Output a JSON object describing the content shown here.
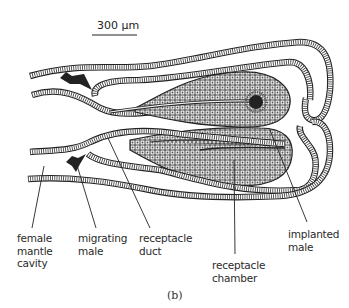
{
  "figure": {
    "panel_label": "(b)",
    "scale_bar": {
      "label": "300 μm"
    },
    "labels": {
      "female_mantle_cavity": [
        "female",
        "mantle",
        "cavity"
      ],
      "migrating_male": [
        "migrating",
        "male"
      ],
      "receptacle_duct": [
        "receptacle",
        "duct"
      ],
      "receptacle_chamber": [
        "receptacle",
        "chamber"
      ],
      "implanted_male": [
        "implanted",
        "male"
      ]
    }
  },
  "colors": {
    "ink": "#222222",
    "background": "#ffffff",
    "tissue": "#555555"
  }
}
